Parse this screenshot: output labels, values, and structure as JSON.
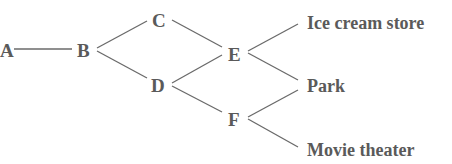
{
  "diagram": {
    "type": "tree",
    "nodes": {
      "A": "A",
      "B": "B",
      "C": "C",
      "D": "D",
      "E": "E",
      "F": "F"
    },
    "destinations": {
      "ice_cream": "Ice cream store",
      "park": "Park",
      "movie": "Movie theater"
    },
    "edges": [
      [
        "A",
        "B"
      ],
      [
        "B",
        "C"
      ],
      [
        "B",
        "D"
      ],
      [
        "C",
        "E"
      ],
      [
        "D",
        "E"
      ],
      [
        "D",
        "F"
      ],
      [
        "E",
        "Ice cream store"
      ],
      [
        "E",
        "Park"
      ],
      [
        "F",
        "Park"
      ],
      [
        "F",
        "Movie theater"
      ]
    ],
    "colors": {
      "line": "#6a6a6a",
      "text": "#5a5a5a"
    }
  }
}
